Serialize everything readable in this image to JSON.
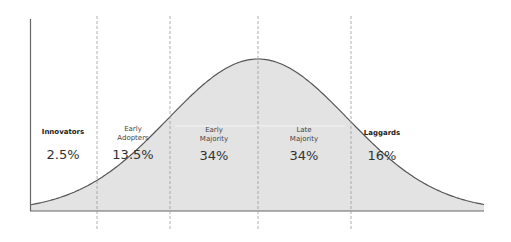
{
  "chart_data": {
    "type": "area",
    "title": "",
    "subtitle": "",
    "xlabel": "",
    "ylabel": "",
    "grid": false,
    "legend": "none",
    "categories": [
      "Innovators",
      "Early Adopters",
      "Early Majority",
      "Late Majority",
      "Laggards"
    ],
    "values": [
      2.5,
      13.5,
      34,
      34,
      16
    ],
    "value_labels": [
      "2.5%",
      "13.5%",
      "34%",
      "34%",
      "16%"
    ],
    "category_labels": [
      {
        "lines": [
          "Innovators"
        ],
        "bold": true
      },
      {
        "lines": [
          "Early",
          "Adopters"
        ],
        "bold": false
      },
      {
        "lines": [
          "Early",
          "Majority"
        ],
        "bold": false
      },
      {
        "lines": [
          "Late",
          "Majority"
        ],
        "bold": false
      },
      {
        "lines": [
          "Laggards"
        ],
        "bold": true
      }
    ],
    "boundaries_std_dev": [
      -2,
      -1,
      0,
      1
    ],
    "colors": {
      "fill": "#e3e3e3",
      "line": "#555555",
      "axis": "#666666",
      "divider": "#999999"
    }
  }
}
